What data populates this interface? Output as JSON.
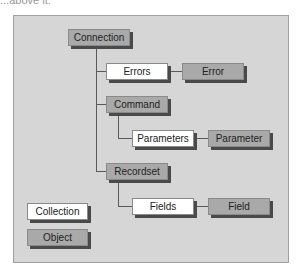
{
  "cutoff_text": "...above it:",
  "diagram": {
    "nodes": [
      {
        "id": "connection",
        "label": "Connection",
        "type": "object"
      },
      {
        "id": "errors",
        "label": "Errors",
        "type": "collection"
      },
      {
        "id": "error",
        "label": "Error",
        "type": "object"
      },
      {
        "id": "command",
        "label": "Command",
        "type": "object"
      },
      {
        "id": "parameters",
        "label": "Parameters",
        "type": "collection"
      },
      {
        "id": "parameter",
        "label": "Parameter",
        "type": "object"
      },
      {
        "id": "recordset",
        "label": "Recordset",
        "type": "object"
      },
      {
        "id": "fields",
        "label": "Fields",
        "type": "collection"
      },
      {
        "id": "field",
        "label": "Field",
        "type": "object"
      }
    ],
    "edges": [
      [
        "connection",
        "errors"
      ],
      [
        "errors",
        "error"
      ],
      [
        "connection",
        "command"
      ],
      [
        "command",
        "parameters"
      ],
      [
        "parameters",
        "parameter"
      ],
      [
        "connection",
        "recordset"
      ],
      [
        "recordset",
        "fields"
      ],
      [
        "fields",
        "field"
      ]
    ],
    "legend": {
      "collection": "Collection",
      "object": "Object"
    },
    "colors": {
      "panel": "#d6d6d6",
      "object": "#a9a9a9",
      "collection": "#ffffff",
      "shadow": "#4a4a4a"
    }
  }
}
